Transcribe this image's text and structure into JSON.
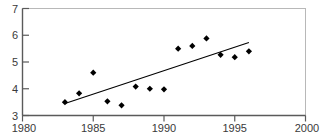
{
  "chart_data": {
    "type": "scatter",
    "title": "",
    "xlabel": "",
    "ylabel": "",
    "xlim": [
      1980,
      2000
    ],
    "ylim": [
      3,
      7
    ],
    "grid": false,
    "legend": null,
    "x_ticks": [
      1980,
      1985,
      1990,
      1995,
      2000
    ],
    "x_tick_labels": [
      "1980",
      "1985",
      "1990",
      "1995",
      "2000"
    ],
    "y_ticks": [
      3,
      4,
      5,
      6,
      7
    ],
    "y_tick_labels": [
      "3",
      "4",
      "5",
      "6",
      "7"
    ],
    "series": [
      {
        "name": "observations",
        "type": "scatter",
        "marker": "diamond",
        "color": "#000000",
        "x": [
          1983,
          1984,
          1985,
          1986,
          1987,
          1988,
          1989,
          1990,
          1991,
          1992,
          1993,
          1994,
          1995,
          1996
        ],
        "values": [
          3.5,
          3.83,
          4.6,
          3.53,
          3.38,
          4.08,
          4.0,
          3.98,
          5.5,
          5.6,
          5.88,
          5.27,
          5.18,
          5.4
        ]
      },
      {
        "name": "trend-line",
        "type": "line",
        "color": "#000000",
        "x": [
          1983,
          1996
        ],
        "values": [
          3.45,
          5.73
        ]
      }
    ]
  },
  "axes": {
    "y_axis_name": "y-axis",
    "x_axis_name": "x-axis"
  },
  "header": {
    "clipped_title": ""
  }
}
